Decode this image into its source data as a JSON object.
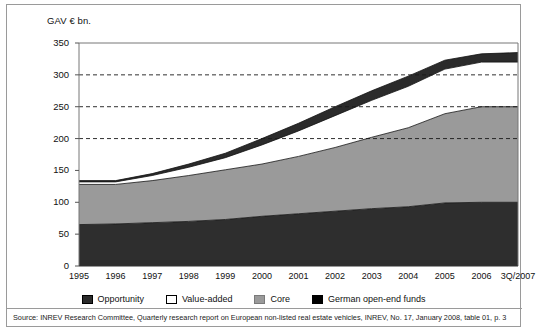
{
  "figure": {
    "axis_title": "GAV € bn.",
    "source": "Source: INREV Research Committee, Quarterly research report on European non-listed real estate vehicles, INREV, No. 17, January 2008, table 01, p. 3"
  },
  "legend": {
    "position": "bottom",
    "items": [
      {
        "label": "Opportunity",
        "swatch": "opportunity",
        "color": "#2b2b2b"
      },
      {
        "label": "Value-added",
        "swatch": "value",
        "color": "#ffffff"
      },
      {
        "label": "Core",
        "swatch": "core",
        "color": "#9a9a9a"
      },
      {
        "label": "German open-end funds",
        "swatch": "german",
        "color": "#000000"
      }
    ]
  },
  "chart_data": {
    "type": "area",
    "title": "",
    "subtitle": "",
    "xlabel": "",
    "ylabel": "GAV € bn.",
    "ylim": [
      0,
      350
    ],
    "yticks": [
      0,
      50,
      100,
      150,
      200,
      250,
      300,
      350
    ],
    "ytick_labels": [
      "0",
      "50",
      "100",
      "150",
      "200",
      "250",
      "300",
      "350"
    ],
    "grid": "horizontal-dashed-at-200-250-300",
    "gridlines": [
      200,
      250,
      300
    ],
    "stacked": true,
    "stack_order_bottom_to_top": [
      "German open-end funds",
      "Core",
      "Value-added",
      "Opportunity"
    ],
    "categories": [
      "1995",
      "1996",
      "1997",
      "1998",
      "1999",
      "2000",
      "2001",
      "2002",
      "2003",
      "2004",
      "2005",
      "2006",
      "3Q/2007"
    ],
    "series": [
      {
        "name": "German open-end funds",
        "color": "#2b2b2b",
        "values": [
          65,
          66,
          68,
          70,
          73,
          78,
          82,
          86,
          90,
          93,
          99,
          100,
          100
        ]
      },
      {
        "name": "Core",
        "color": "#9a9a9a",
        "values": [
          63,
          62,
          66,
          72,
          78,
          82,
          90,
          100,
          112,
          124,
          140,
          150,
          150
        ]
      },
      {
        "name": "Value-added",
        "color": "#ffffff",
        "values": [
          4,
          4,
          8,
          13,
          19,
          30,
          40,
          50,
          58,
          65,
          70,
          70,
          70
        ]
      },
      {
        "name": "Opportunity",
        "color": "#2b2b2b",
        "values": [
          2,
          2,
          3,
          5,
          7,
          10,
          12,
          14,
          15,
          16,
          14,
          13,
          15
        ]
      }
    ],
    "cumulative_totals": [
      134,
      134,
      145,
      160,
      177,
      200,
      224,
      250,
      275,
      298,
      323,
      333,
      335
    ]
  }
}
